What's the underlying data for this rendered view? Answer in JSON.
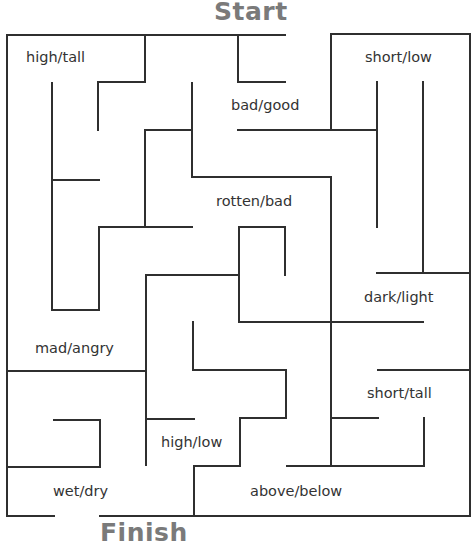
{
  "maze": {
    "start_label": "Start",
    "finish_label": "Finish",
    "word_pairs": [
      {
        "id": "high-tall",
        "text": "high/tall",
        "x": 26,
        "y": 49
      },
      {
        "id": "bad-good",
        "text": "bad/good",
        "x": 231,
        "y": 97
      },
      {
        "id": "short-low",
        "text": "short/low",
        "x": 365,
        "y": 49
      },
      {
        "id": "rotten-bad",
        "text": "rotten/bad",
        "x": 216,
        "y": 193
      },
      {
        "id": "dark-light",
        "text": "dark/light",
        "x": 364,
        "y": 289
      },
      {
        "id": "mad-angry",
        "text": "mad/angry",
        "x": 35,
        "y": 340
      },
      {
        "id": "short-tall",
        "text": "short/tall",
        "x": 367,
        "y": 385
      },
      {
        "id": "high-low",
        "text": "high/low",
        "x": 161,
        "y": 434
      },
      {
        "id": "wet-dry",
        "text": "wet/dry",
        "x": 53,
        "y": 483
      },
      {
        "id": "above-below",
        "text": "above/below",
        "x": 250,
        "y": 483
      }
    ],
    "colors": {
      "title": "#7a7a7a",
      "walls": "#2f2f2f",
      "text": "#333333",
      "background": "#ffffff"
    }
  }
}
